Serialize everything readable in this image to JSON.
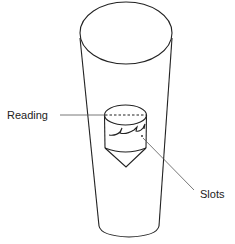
{
  "diagram": {
    "labels": {
      "reading": "Reading",
      "slots": "Slots"
    },
    "colors": {
      "stroke": "#222222",
      "leader": "#555555",
      "background": "#ffffff"
    }
  }
}
